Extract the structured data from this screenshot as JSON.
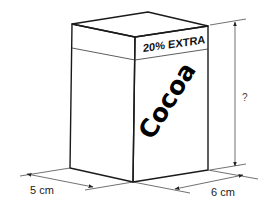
{
  "diagram": {
    "band_label": "20% EXTRA",
    "brand_label": "Cocoa",
    "dimensions": {
      "width_label": "5 cm",
      "depth_label": "6 cm",
      "height_label": "?"
    }
  }
}
